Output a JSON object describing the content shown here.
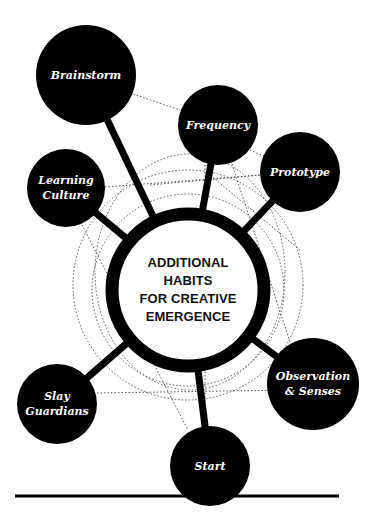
{
  "diagram": {
    "title_lines": [
      "ADDITIONAL",
      "HABITS",
      "FOR CREATIVE",
      "EMERGENCE"
    ],
    "colors": {
      "ink": "#000000",
      "paper": "#ffffff",
      "node_text": "#ffffff",
      "dotted": "#555555"
    },
    "hub": {
      "cx": 188,
      "cy": 290,
      "r": 76,
      "stroke": 13
    },
    "nodes": [
      {
        "id": "brainstorm",
        "lines": [
          "Brainstorm"
        ],
        "cx": 86,
        "cy": 75,
        "r": 50
      },
      {
        "id": "frequency",
        "lines": [
          "Frequency"
        ],
        "cx": 218,
        "cy": 125,
        "r": 40
      },
      {
        "id": "prototype",
        "lines": [
          "Prototype"
        ],
        "cx": 300,
        "cy": 172,
        "r": 40
      },
      {
        "id": "learning-culture",
        "lines": [
          "Learning",
          "Culture"
        ],
        "cx": 66,
        "cy": 188,
        "r": 39
      },
      {
        "id": "slay-guardians",
        "lines": [
          "Slay",
          "Guardians"
        ],
        "cx": 57,
        "cy": 404,
        "r": 40
      },
      {
        "id": "observation-senses",
        "lines": [
          "Observation",
          "& Senses"
        ],
        "cx": 313,
        "cy": 384,
        "r": 46
      },
      {
        "id": "start",
        "lines": [
          "Start"
        ],
        "cx": 210,
        "cy": 466,
        "r": 40
      }
    ],
    "baseline": {
      "x1": 15,
      "x2": 339,
      "y": 496,
      "width": 3
    }
  }
}
